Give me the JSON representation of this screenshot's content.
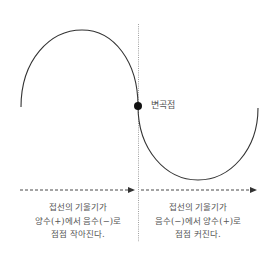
{
  "diagram": {
    "type": "inflection-point-curve",
    "colors": {
      "curve": "#333333",
      "dotted_line": "#888888",
      "arrow": "#333333",
      "point": "#111111",
      "text": "#555555"
    },
    "inflection_point": {
      "label": "변곡점"
    },
    "left_region": {
      "caption": [
        "접선의 기울기가",
        "양수(+)에서 음수(−)로",
        "점점 작아진다."
      ]
    },
    "right_region": {
      "caption": [
        "접선의 기울기가",
        "음수(−)에서 양수(+)로",
        "점점 커진다."
      ]
    }
  }
}
